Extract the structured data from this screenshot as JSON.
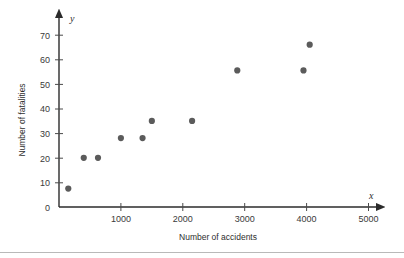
{
  "chart_data": {
    "type": "scatter",
    "title": "",
    "xlabel": "Number of accidents",
    "ylabel": "Number of fatalities",
    "x_axis_name": "x",
    "y_axis_name": "y",
    "xlim": [
      0,
      5400
    ],
    "ylim": [
      0,
      75
    ],
    "grid": false,
    "legend": null,
    "xticks": [
      1000,
      2000,
      3000,
      4000,
      5000
    ],
    "xtick_labels": [
      "1000",
      "2000",
      "3000",
      "4000",
      "5000"
    ],
    "yticks": [
      0,
      10,
      20,
      30,
      40,
      50,
      60,
      70
    ],
    "ytick_labels": [
      "0",
      "10",
      "20",
      "30",
      "40",
      "50",
      "60",
      "70"
    ],
    "marker": "circle",
    "marker_color": "#5b5b5b",
    "marker_size": 3.1,
    "points": [
      {
        "x": 150,
        "y": 7.5
      },
      {
        "x": 400,
        "y": 20
      },
      {
        "x": 630,
        "y": 20
      },
      {
        "x": 1000,
        "y": 28
      },
      {
        "x": 1350,
        "y": 28
      },
      {
        "x": 1500,
        "y": 35
      },
      {
        "x": 2150,
        "y": 35
      },
      {
        "x": 2880,
        "y": 55.5
      },
      {
        "x": 3950,
        "y": 55.5
      },
      {
        "x": 4050,
        "y": 66
      }
    ]
  },
  "axis_geometry": {
    "origin_px": {
      "x": 59,
      "y": 207
    },
    "x_px_per_unit": 0.0619,
    "y_px_per_unit": 2.46
  },
  "colors": {
    "axis": "#2b2b2b",
    "marker": "#5b5b5b",
    "text": "#2e2e2e",
    "rule": "#b9b9b9"
  }
}
